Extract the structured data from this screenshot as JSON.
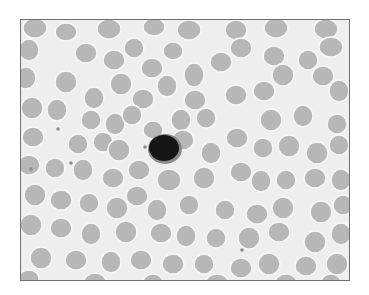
{
  "image": {
    "description": "Grayscale light-microscopy blood smear showing many red blood cells and a single dark-stained lymphocyte near the center",
    "frame": {
      "x": 20,
      "y": 19,
      "width": 330,
      "height": 262,
      "border_color": "#707070"
    },
    "colors": {
      "background": "#eeeeee",
      "rbc_fill": "#b7b7b7",
      "rbc_rim": "#f6f6f6",
      "nucleus": "#151515",
      "cytoplasm": "#8a8a8a",
      "platelet": "#8c8c8c"
    },
    "lymphocyte": {
      "cx": 143,
      "cy": 128,
      "rx": 15,
      "ry": 13
    },
    "platelets": [
      [
        37,
        109
      ],
      [
        50,
        143
      ],
      [
        221,
        230
      ],
      [
        124,
        127
      ],
      [
        330,
        139
      ],
      [
        10,
        149
      ]
    ],
    "rbcs": [
      [
        14,
        8,
        12,
        10
      ],
      [
        45,
        12,
        11,
        9
      ],
      [
        88,
        9,
        12,
        10
      ],
      [
        133,
        7,
        11,
        9
      ],
      [
        168,
        10,
        12,
        10
      ],
      [
        215,
        10,
        11,
        10
      ],
      [
        255,
        8,
        12,
        10
      ],
      [
        305,
        9,
        12,
        10
      ],
      [
        8,
        30,
        10,
        11
      ],
      [
        65,
        33,
        11,
        10
      ],
      [
        93,
        40,
        11,
        10
      ],
      [
        113,
        28,
        10,
        10
      ],
      [
        131,
        48,
        11,
        10
      ],
      [
        152,
        31,
        10,
        9
      ],
      [
        173,
        55,
        10,
        12
      ],
      [
        200,
        42,
        11,
        10
      ],
      [
        220,
        28,
        11,
        10
      ],
      [
        253,
        36,
        11,
        10
      ],
      [
        287,
        40,
        10,
        10
      ],
      [
        310,
        27,
        12,
        10
      ],
      [
        5,
        58,
        10,
        11
      ],
      [
        45,
        62,
        11,
        11
      ],
      [
        73,
        78,
        10,
        11
      ],
      [
        100,
        64,
        11,
        11
      ],
      [
        122,
        79,
        11,
        10
      ],
      [
        146,
        66,
        10,
        11
      ],
      [
        174,
        80,
        11,
        10
      ],
      [
        215,
        75,
        11,
        10
      ],
      [
        243,
        71,
        11,
        10
      ],
      [
        262,
        55,
        11,
        11
      ],
      [
        302,
        56,
        11,
        10
      ],
      [
        318,
        71,
        10,
        11
      ],
      [
        11,
        88,
        11,
        11
      ],
      [
        36,
        90,
        10,
        11
      ],
      [
        70,
        100,
        10,
        10
      ],
      [
        94,
        104,
        10,
        11
      ],
      [
        111,
        95,
        10,
        10
      ],
      [
        132,
        110,
        10,
        9
      ],
      [
        160,
        100,
        10,
        11
      ],
      [
        185,
        98,
        10,
        10
      ],
      [
        250,
        100,
        11,
        11
      ],
      [
        282,
        96,
        10,
        11
      ],
      [
        316,
        104,
        10,
        10
      ],
      [
        12,
        117,
        11,
        10
      ],
      [
        57,
        124,
        10,
        10
      ],
      [
        82,
        122,
        10,
        10
      ],
      [
        98,
        130,
        11,
        11
      ],
      [
        118,
        150,
        11,
        10
      ],
      [
        162,
        120,
        11,
        10
      ],
      [
        190,
        133,
        10,
        11
      ],
      [
        216,
        118,
        11,
        10
      ],
      [
        242,
        128,
        10,
        10
      ],
      [
        268,
        126,
        11,
        11
      ],
      [
        296,
        133,
        11,
        11
      ],
      [
        318,
        125,
        10,
        10
      ],
      [
        8,
        145,
        11,
        10
      ],
      [
        34,
        148,
        10,
        10
      ],
      [
        62,
        150,
        10,
        11
      ],
      [
        92,
        158,
        11,
        10
      ],
      [
        116,
        176,
        11,
        10
      ],
      [
        148,
        160,
        12,
        11
      ],
      [
        183,
        158,
        11,
        11
      ],
      [
        220,
        152,
        11,
        10
      ],
      [
        240,
        161,
        10,
        11
      ],
      [
        265,
        160,
        10,
        10
      ],
      [
        294,
        158,
        11,
        10
      ],
      [
        320,
        160,
        10,
        11
      ],
      [
        14,
        175,
        11,
        11
      ],
      [
        40,
        180,
        11,
        10
      ],
      [
        68,
        183,
        10,
        10
      ],
      [
        96,
        188,
        11,
        11
      ],
      [
        136,
        190,
        10,
        11
      ],
      [
        168,
        185,
        10,
        10
      ],
      [
        204,
        190,
        10,
        10
      ],
      [
        236,
        194,
        11,
        10
      ],
      [
        262,
        188,
        11,
        11
      ],
      [
        300,
        192,
        11,
        11
      ],
      [
        322,
        185,
        10,
        10
      ],
      [
        10,
        205,
        11,
        11
      ],
      [
        40,
        208,
        11,
        10
      ],
      [
        70,
        214,
        10,
        11
      ],
      [
        105,
        212,
        11,
        11
      ],
      [
        140,
        213,
        11,
        10
      ],
      [
        165,
        216,
        10,
        11
      ],
      [
        195,
        218,
        10,
        10
      ],
      [
        228,
        218,
        11,
        11
      ],
      [
        258,
        212,
        11,
        10
      ],
      [
        294,
        222,
        11,
        11
      ],
      [
        320,
        214,
        10,
        11
      ],
      [
        20,
        238,
        11,
        11
      ],
      [
        55,
        240,
        11,
        10
      ],
      [
        90,
        242,
        10,
        11
      ],
      [
        120,
        240,
        11,
        10
      ],
      [
        152,
        244,
        11,
        10
      ],
      [
        183,
        244,
        10,
        10
      ],
      [
        220,
        248,
        11,
        10
      ],
      [
        248,
        244,
        11,
        11
      ],
      [
        285,
        246,
        11,
        10
      ],
      [
        316,
        244,
        11,
        11
      ],
      [
        8,
        258,
        10,
        8
      ],
      [
        74,
        262,
        11,
        9
      ],
      [
        132,
        262,
        10,
        8
      ],
      [
        196,
        262,
        11,
        8
      ],
      [
        265,
        263,
        11,
        9
      ],
      [
        310,
        262,
        10,
        8
      ]
    ]
  }
}
